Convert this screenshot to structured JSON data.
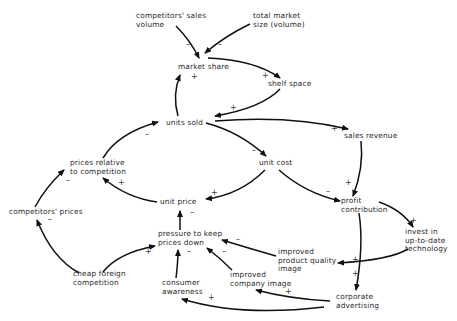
{
  "diagram": {
    "type": "causal-loop",
    "nodes": [
      {
        "id": "competitors_sales_volume",
        "lines": [
          "competitors' sales",
          "volume"
        ],
        "x": 136,
        "y": 18
      },
      {
        "id": "total_market_size",
        "lines": [
          "total market",
          "size (volume)"
        ],
        "x": 253,
        "y": 18
      },
      {
        "id": "market_share",
        "lines": [
          "market share"
        ],
        "x": 178,
        "y": 69
      },
      {
        "id": "shelf_space",
        "lines": [
          "shelf space"
        ],
        "x": 268,
        "y": 86
      },
      {
        "id": "units_sold",
        "lines": [
          "units sold"
        ],
        "x": 166,
        "y": 125
      },
      {
        "id": "sales_revenue",
        "lines": [
          "sales revenue"
        ],
        "x": 344,
        "y": 138
      },
      {
        "id": "prices_relative",
        "lines": [
          "prices relative",
          "to competition"
        ],
        "x": 70,
        "y": 165
      },
      {
        "id": "unit_cost",
        "lines": [
          "unit cost"
        ],
        "x": 259,
        "y": 165
      },
      {
        "id": "unit_price",
        "lines": [
          "unit price"
        ],
        "x": 160,
        "y": 204
      },
      {
        "id": "profit_contribution",
        "lines": [
          "profit",
          "contribution"
        ],
        "x": 341,
        "y": 203
      },
      {
        "id": "competitors_prices",
        "lines": [
          "competitors' prices"
        ],
        "x": 9,
        "y": 214
      },
      {
        "id": "invest_technology",
        "lines": [
          "invest in",
          "up-to-date",
          "technology"
        ],
        "x": 405,
        "y": 234
      },
      {
        "id": "pressure_prices_down",
        "lines": [
          "pressure to keep",
          "prices down"
        ],
        "x": 158,
        "y": 236
      },
      {
        "id": "improved_product_quality",
        "lines": [
          "improved",
          "product quality",
          "image"
        ],
        "x": 278,
        "y": 254
      },
      {
        "id": "cheap_foreign",
        "lines": [
          "cheap foreign",
          "competition"
        ],
        "x": 73,
        "y": 276
      },
      {
        "id": "improved_company_image",
        "lines": [
          "improved",
          "company image"
        ],
        "x": 230,
        "y": 277
      },
      {
        "id": "consumer_awareness",
        "lines": [
          "consumer",
          "awareness"
        ],
        "x": 162,
        "y": 285
      },
      {
        "id": "corporate_advertising",
        "lines": [
          "corporate",
          "advertising"
        ],
        "x": 336,
        "y": 299
      }
    ],
    "edges": [
      {
        "from": "competitors_sales_volume",
        "to": "market_share",
        "sign": "–",
        "path": "M 176 26 Q 190 40 199 58",
        "sx": 186,
        "sy": 47
      },
      {
        "from": "total_market_size",
        "to": "market_share",
        "sign": "–",
        "path": "M 250 24 Q 225 36 205 53",
        "sx": 218,
        "sy": 47
      },
      {
        "from": "market_share",
        "to": "shelf_space",
        "sign": "+",
        "path": "M 208 58 Q 255 60 280 78",
        "sx": 262,
        "sy": 78
      },
      {
        "from": "shelf_space",
        "to": "units_sold",
        "sign": "+",
        "path": "M 280 89 Q 262 108 215 116",
        "sx": 230,
        "sy": 110
      },
      {
        "from": "units_sold",
        "to": "market_share",
        "sign": "+",
        "path": "M 178 116 Q 172 95 180 75",
        "sx": 191,
        "sy": 79
      },
      {
        "from": "units_sold",
        "to": "sales_revenue",
        "sign": "+",
        "path": "M 215 121 Q 290 115 348 129",
        "sx": 331,
        "sy": 131
      },
      {
        "from": "units_sold",
        "to": "unit_cost",
        "sign": "–",
        "path": "M 206 123 Q 240 132 266 156",
        "sx": 252,
        "sy": 153
      },
      {
        "from": "prices_relative",
        "to": "units_sold",
        "sign": "–",
        "path": "M 103 158 Q 118 133 158 122",
        "sx": 145,
        "sy": 137
      },
      {
        "from": "unit_price",
        "to": "prices_relative",
        "sign": "+",
        "path": "M 157 202 Q 127 198 103 178",
        "sx": 118,
        "sy": 185
      },
      {
        "from": "unit_cost",
        "to": "unit_price",
        "sign": "+",
        "path": "M 265 170 Q 240 195 206 199",
        "sx": 211,
        "sy": 195
      },
      {
        "from": "unit_cost",
        "to": "profit_contribution",
        "sign": "–",
        "path": "M 279 170 Q 305 193 340 201",
        "sx": 326,
        "sy": 194
      },
      {
        "from": "sales_revenue",
        "to": "profit_contribution",
        "sign": "+",
        "path": "M 361 141 Q 364 168 353 196",
        "sx": 345,
        "sy": 185
      },
      {
        "from": "competitors_prices",
        "to": "prices_relative",
        "sign": "–",
        "path": "M 35 207 Q 45 188 64 170",
        "sx": 66,
        "sy": 183
      },
      {
        "from": "cheap_foreign",
        "to": "competitors_prices",
        "sign": "–",
        "path": "M 79 273 Q 52 258 37 220",
        "sx": 48,
        "sy": 222
      },
      {
        "from": "cheap_foreign",
        "to": "pressure_prices_down",
        "sign": "+",
        "path": "M 103 272 Q 118 253 155 246",
        "sx": 145,
        "sy": 254
      },
      {
        "from": "pressure_prices_down",
        "to": "unit_price",
        "sign": "–",
        "path": "M 180 230 L 180 211",
        "sx": 190,
        "sy": 215
      },
      {
        "from": "consumer_awareness",
        "to": "pressure_prices_down",
        "sign": "–",
        "path": "M 176 278 Q 178 262 178 250",
        "sx": 187,
        "sy": 254
      },
      {
        "from": "improved_company_image",
        "to": "pressure_prices_down",
        "sign": "–",
        "path": "M 232 270 Q 220 258 207 248",
        "sx": 222,
        "sy": 254
      },
      {
        "from": "improved_product_quality",
        "to": "pressure_prices_down",
        "sign": "–",
        "path": "M 276 256 Q 248 248 222 240",
        "sx": 236,
        "sy": 242
      },
      {
        "from": "profit_contribution",
        "to": "invest_technology",
        "sign": "+",
        "path": "M 379 202 Q 402 210 413 227",
        "sx": 410,
        "sy": 223
      },
      {
        "from": "invest_technology",
        "to": "improved_product_quality",
        "sign": "+",
        "path": "M 408 249 Q 390 260 338 263",
        "sx": 352,
        "sy": 262
      },
      {
        "from": "profit_contribution",
        "to": "corporate_advertising",
        "sign": "+",
        "path": "M 359 213 Q 364 245 356 290",
        "sx": 352,
        "sy": 276
      },
      {
        "from": "corporate_advertising",
        "to": "improved_company_image",
        "sign": "+",
        "path": "M 330 301 Q 290 299 256 290",
        "sx": 285,
        "sy": 294
      },
      {
        "from": "corporate_advertising",
        "to": "consumer_awareness",
        "sign": "+",
        "path": "M 324 307 Q 240 317 182 299",
        "sx": 208,
        "sy": 300
      }
    ]
  }
}
